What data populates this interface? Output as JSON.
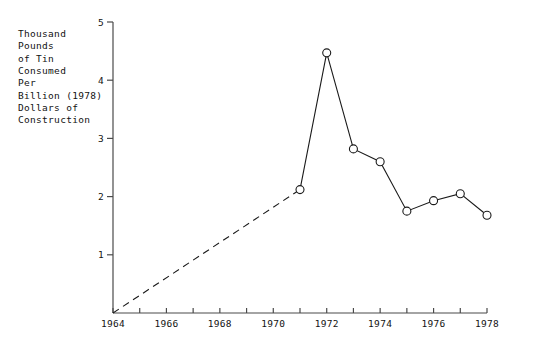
{
  "chart_data": {
    "type": "line",
    "title": "",
    "subtitle": "",
    "xlabel": "",
    "ylabel": "Thousand\nPounds\nof Tin\nConsumed\nPer\nBillion (1978)\nDollars of\nConstruction",
    "xlim": [
      1964,
      1978
    ],
    "ylim": [
      0,
      5
    ],
    "grid": false,
    "legend": null,
    "x_tick_labels": [
      "1964",
      "1966",
      "1968",
      "1970",
      "1972",
      "1974",
      "1976",
      "1978"
    ],
    "x_tick_values": [
      1964,
      1966,
      1968,
      1970,
      1972,
      1974,
      1976,
      1978
    ],
    "x_minor_ticks": [
      1965,
      1967,
      1969,
      1971,
      1973,
      1975,
      1977
    ],
    "y_tick_labels": [
      "1",
      "2",
      "3",
      "4",
      "5"
    ],
    "y_tick_values": [
      1,
      2,
      3,
      4,
      5
    ],
    "series": [
      {
        "name": "Tin consumed per billion dollars of construction",
        "style": "dashed",
        "markers": false,
        "x": [
          1964,
          1971
        ],
        "values": [
          0.0,
          2.12
        ]
      },
      {
        "name": "Tin consumed per billion dollars of construction",
        "style": "solid",
        "markers": true,
        "x": [
          1971,
          1972,
          1973,
          1974,
          1975,
          1976,
          1977,
          1978
        ],
        "values": [
          2.12,
          4.47,
          2.82,
          2.6,
          1.75,
          1.93,
          2.05,
          1.68
        ]
      }
    ],
    "colors": {
      "axis": "#4a4a4a",
      "line": "#1a1a1a",
      "marker_fill": "#ffffff",
      "marker_stroke": "#1a1a1a",
      "text": "#121212"
    }
  }
}
